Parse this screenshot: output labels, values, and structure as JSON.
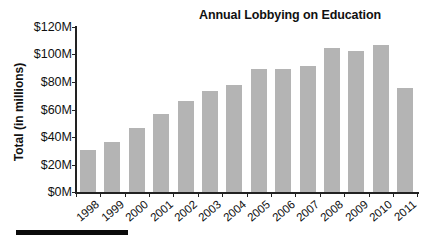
{
  "chart_data": {
    "type": "bar",
    "title": "Annual Lobbying on Education",
    "xlabel": "",
    "ylabel": "Total (in millions)",
    "ylim": [
      0,
      120
    ],
    "yticks": [
      "$0M",
      "$20M",
      "$40M",
      "$60M",
      "$80M",
      "$100M",
      "$120M"
    ],
    "ytick_values": [
      0,
      20,
      40,
      60,
      80,
      100,
      120
    ],
    "categories": [
      "1998",
      "1999",
      "2000",
      "2001",
      "2002",
      "2003",
      "2004",
      "2005",
      "2006",
      "2007",
      "2008",
      "2009",
      "2010",
      "2011"
    ],
    "values": [
      30.6,
      36.7,
      46.8,
      56.7,
      66.2,
      73.4,
      78.0,
      89.4,
      89.4,
      91.5,
      104.6,
      102.2,
      106.7,
      75.6
    ],
    "grid": false,
    "legend": null,
    "bar_color": "#b4b4b4"
  }
}
